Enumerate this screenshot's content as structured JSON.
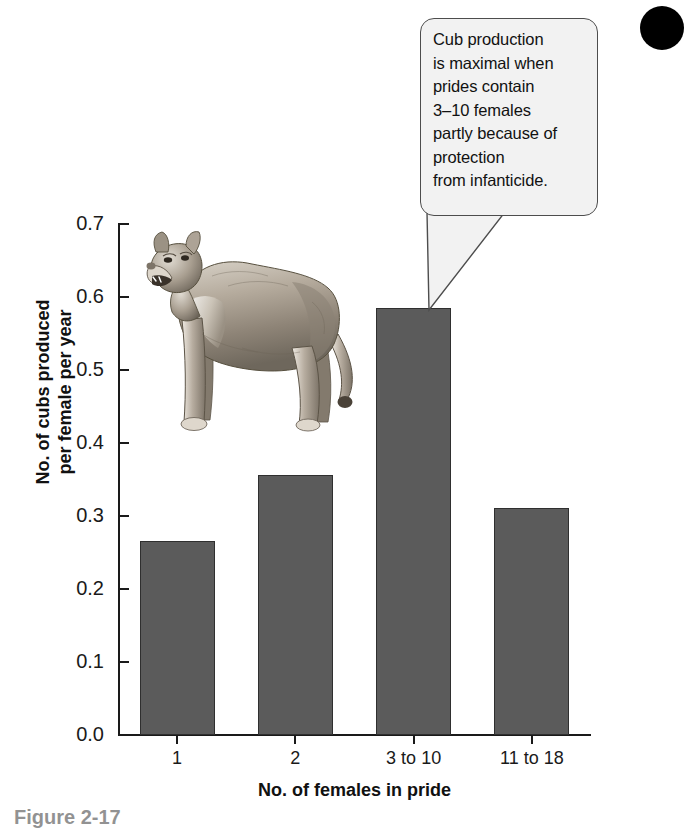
{
  "chart_data": {
    "type": "bar",
    "title": "",
    "categories": [
      "1",
      "2",
      "3 to 10",
      "11 to 18"
    ],
    "values": [
      0.266,
      0.356,
      0.585,
      0.311
    ],
    "xlabel": "No. of females in pride",
    "ylabel": "No. of cubs produced per female per year",
    "ylim": [
      0.0,
      0.7
    ],
    "yticks": [
      "0.0",
      "0.1",
      "0.2",
      "0.3",
      "0.4",
      "0.5",
      "0.6",
      "0.7"
    ],
    "ytick_values": [
      0.0,
      0.1,
      0.2,
      0.3,
      0.4,
      0.5,
      0.6,
      0.7
    ],
    "grid": false,
    "legend": null,
    "bar_color": "#5b5b5b",
    "annotations": [
      {
        "text": "Cub production is maximal when prides contain 3–10 females partly because of protection from infanticide.",
        "points_to_category": "3 to 10"
      }
    ]
  },
  "callout": {
    "lines": [
      "Cub production",
      "is maximal when",
      "prides contain",
      "3–10 females",
      "partly because of",
      "protection",
      "from infanticide."
    ],
    "fill": "#f2f2f2",
    "border": "#4d4d4d"
  },
  "ylabel_lines": [
    "No. of cubs produced",
    "per female per year"
  ],
  "xlabel": "No. of females in pride",
  "caption": "Figure 2-17",
  "marker": {
    "shape": "filled-circle",
    "color": "#000000"
  }
}
